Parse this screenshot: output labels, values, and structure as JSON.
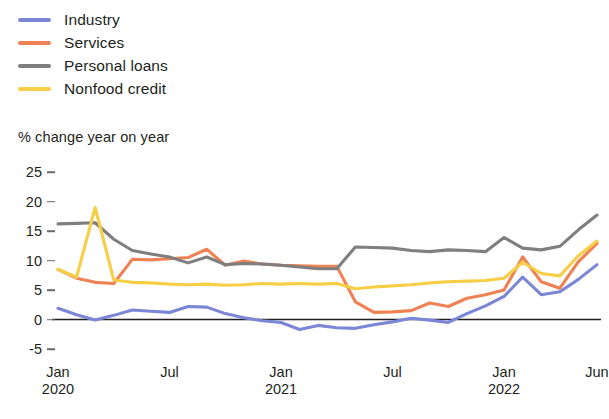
{
  "legend": {
    "position": "top-left",
    "items": [
      {
        "label": "Industry",
        "color": "#7b86d6",
        "key": "industry"
      },
      {
        "label": "Services",
        "color": "#ef8254",
        "key": "services"
      },
      {
        "label": "Personal loans",
        "color": "#7f7f7f",
        "key": "personal_loans"
      },
      {
        "label": "Nonfood credit",
        "color": "#f7ce46",
        "key": "nonfood_credit"
      }
    ]
  },
  "axis_title": "% change year on year",
  "y_axis": {
    "ticks": [
      "25",
      "20",
      "15",
      "10",
      "5",
      "0",
      "-5"
    ],
    "values": [
      25,
      20,
      15,
      10,
      5,
      0,
      -5
    ],
    "min": -5,
    "max": 25
  },
  "x_axis": {
    "ticks": [
      {
        "month": "Jan",
        "year": "2020",
        "index": 0
      },
      {
        "month": "Jul",
        "year": "",
        "index": 6
      },
      {
        "month": "Jan",
        "year": "2021",
        "index": 12
      },
      {
        "month": "Jul",
        "year": "",
        "index": 18
      },
      {
        "month": "Jan",
        "year": "2022",
        "index": 24
      },
      {
        "month": "Jun",
        "year": "",
        "index": 29
      }
    ]
  },
  "chart_data": {
    "type": "line",
    "title": "",
    "subtitle": "% change year on year",
    "xlabel": "",
    "ylabel": "% change year on year",
    "ylim": [
      -5,
      25
    ],
    "grid": false,
    "zero_line": true,
    "legend_position": "top-left",
    "x": [
      "Jan 2020",
      "Feb 2020",
      "Mar 2020",
      "Apr 2020",
      "May 2020",
      "Jun 2020",
      "Jul 2020",
      "Aug 2020",
      "Sep 2020",
      "Oct 2020",
      "Nov 2020",
      "Dec 2020",
      "Jan 2021",
      "Feb 2021",
      "Mar 2021",
      "Apr 2021",
      "May 2021",
      "Jun 2021",
      "Jul 2021",
      "Aug 2021",
      "Sep 2021",
      "Oct 2021",
      "Nov 2021",
      "Dec 2021",
      "Jan 2022",
      "Feb 2022",
      "Mar 2022",
      "Apr 2022",
      "May 2022",
      "Jun 2022"
    ],
    "series": [
      {
        "name": "Industry",
        "color": "#7b86d6",
        "values": [
          1.9,
          0.8,
          -0.1,
          0.7,
          1.6,
          1.4,
          1.2,
          2.2,
          2.1,
          1.0,
          0.3,
          -0.2,
          -0.5,
          -1.7,
          -1.0,
          -1.4,
          -1.5,
          -0.9,
          -0.4,
          0.2,
          -0.1,
          -0.5,
          1.0,
          2.3,
          3.9,
          7.2,
          4.2,
          4.7,
          6.8,
          9.3
        ]
      },
      {
        "name": "Services",
        "color": "#ef8254",
        "values": [
          8.5,
          7.0,
          6.3,
          6.1,
          10.2,
          10.1,
          10.3,
          10.5,
          11.9,
          9.2,
          9.9,
          9.4,
          9.2,
          9.1,
          9.0,
          9.0,
          3.0,
          1.2,
          1.3,
          1.5,
          2.8,
          2.2,
          3.6,
          4.2,
          5.0,
          10.6,
          6.4,
          5.3,
          9.8,
          12.9
        ]
      },
      {
        "name": "Personal loans",
        "color": "#7f7f7f",
        "values": [
          16.2,
          16.3,
          16.4,
          13.6,
          11.7,
          11.1,
          10.6,
          9.6,
          10.6,
          9.3,
          9.5,
          9.4,
          9.2,
          8.9,
          8.6,
          8.6,
          12.3,
          12.2,
          12.1,
          11.7,
          11.5,
          11.8,
          11.7,
          11.5,
          13.9,
          12.1,
          11.8,
          12.4,
          15.2,
          17.7
        ]
      },
      {
        "name": "Nonfood credit",
        "color": "#f7ce46",
        "values": [
          8.5,
          7.2,
          19.0,
          6.7,
          6.3,
          6.2,
          6.0,
          5.9,
          6.0,
          5.8,
          5.9,
          6.1,
          6.0,
          6.1,
          6.0,
          6.1,
          5.2,
          5.5,
          5.7,
          5.9,
          6.2,
          6.4,
          6.5,
          6.6,
          7.0,
          9.7,
          7.8,
          7.4,
          10.8,
          13.3
        ]
      }
    ]
  }
}
